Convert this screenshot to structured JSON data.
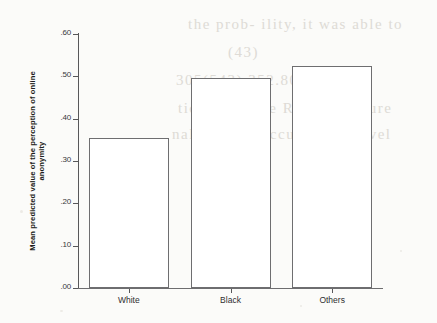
{
  "chart_data": {
    "type": "bar",
    "title": "",
    "subtitle": "",
    "xlabel": "",
    "ylabel": "Mean predicted value of the perception of online anonymity",
    "ylabel_lines": [
      "Mean predicted value of the perception of online",
      "anonymity"
    ],
    "categories": [
      "White",
      "Black",
      "Others"
    ],
    "values": [
      0.355,
      0.495,
      0.525
    ],
    "ylim": [
      0.0,
      0.6
    ],
    "ytick_values": [
      0.0,
      0.1,
      0.2,
      0.3,
      0.4,
      0.5,
      0.6
    ],
    "ytick_labels": [
      ".00",
      ".10",
      ".20",
      ".30",
      ".40",
      ".50",
      ".60"
    ],
    "grid": false,
    "legend": null,
    "bar_fill": "#ffffff",
    "bar_outline": "#6e6e70",
    "axis_color": "#58585a",
    "background": "#fbfbf9"
  },
  "scan_artifacts": {
    "ghost_text": [
      "the prob- ility, it was able to",
      "(43)",
      "305(543) 352.800(3) 0.79",
      "tic the Above Related Figure",
      "nalitie may occur in the level"
    ]
  }
}
